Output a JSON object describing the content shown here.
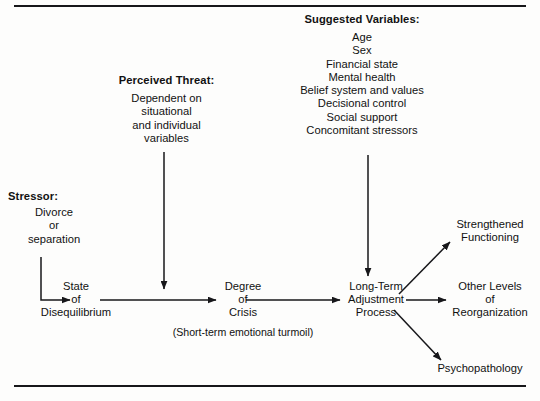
{
  "figure": {
    "type": "flow-diagram",
    "title_rules": {
      "top_rule": "horizontal-rule",
      "bottom_rule": "horizontal-rule"
    }
  },
  "nodes": {
    "suggested_variables": {
      "heading": "Suggested Variables:",
      "items": [
        "Age",
        "Sex",
        "Financial state",
        "Mental health",
        "Belief system and values",
        "Decisional control",
        "Social support",
        "Concomitant stressors"
      ]
    },
    "perceived_threat": {
      "heading": "Perceived Threat:",
      "lines": [
        "Dependent on",
        "situational",
        "and individual",
        "variables"
      ]
    },
    "stressor": {
      "heading": "Stressor:",
      "lines": [
        "Divorce",
        "or",
        "separation"
      ]
    },
    "state_of_disequilibrium": {
      "lines": [
        "State",
        "of",
        "Disequilibrium"
      ]
    },
    "degree_of_crisis": {
      "lines": [
        "Degree",
        "of",
        "Crisis"
      ]
    },
    "short_term_note": {
      "text": "(Short-term emotional turmoil)"
    },
    "long_term_adjustment_process": {
      "lines": [
        "Long-Term",
        "Adjustment",
        "Process"
      ]
    },
    "strengthened_functioning": {
      "lines": [
        "Strengthened",
        "Functioning"
      ]
    },
    "other_levels_of_reorganization": {
      "lines": [
        "Other Levels",
        "of",
        "Reorganization"
      ]
    },
    "psychopathology": {
      "lines": [
        "Psychopathology"
      ]
    }
  },
  "edges": [
    {
      "id": "stressor-to-state",
      "from": "stressor",
      "to": "state_of_disequilibrium",
      "style": "elbow-down-right"
    },
    {
      "id": "state-to-degree",
      "from": "state_of_disequilibrium",
      "to": "degree_of_crisis",
      "style": "horizontal"
    },
    {
      "id": "degree-to-longterm",
      "from": "degree_of_crisis",
      "to": "long_term_adjustment_process",
      "style": "horizontal"
    },
    {
      "id": "perceived-threat-to-flow",
      "from": "perceived_threat",
      "to": "state-to-degree",
      "style": "vertical-down"
    },
    {
      "id": "suggested-variables-to-longterm",
      "from": "suggested_variables",
      "to": "long_term_adjustment_process",
      "style": "vertical-down"
    },
    {
      "id": "longterm-to-strengthened",
      "from": "long_term_adjustment_process",
      "to": "strengthened_functioning",
      "style": "diagonal-up-right"
    },
    {
      "id": "longterm-to-otherlevels",
      "from": "long_term_adjustment_process",
      "to": "other_levels_of_reorganization",
      "style": "horizontal"
    },
    {
      "id": "longterm-to-psychopathology",
      "from": "long_term_adjustment_process",
      "to": "psychopathology",
      "style": "diagonal-down-right"
    }
  ],
  "colors": {
    "ink": "#17171a",
    "background": "#fdfdfc"
  }
}
